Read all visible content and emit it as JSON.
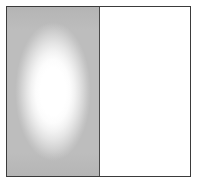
{
  "figure": {
    "title": "",
    "caption": "",
    "canvas": {
      "width_px": 197,
      "height_px": 183,
      "background_color": "#ffffff"
    },
    "frame": {
      "border_color": "#3b3b3b",
      "border_width_px": 1,
      "inset_px": 6
    },
    "divider": {
      "orientation": "vertical",
      "color": "#4a4a4a",
      "width_px": 1,
      "position_fraction": 0.51
    },
    "panels": [
      {
        "id": "left",
        "label": "",
        "type": "radial-gradient-field",
        "background_color": "#bdbdbd",
        "highlight_color": "#ffffff",
        "edge_color": "#bdbdbd",
        "highlight_shape": "ellipse",
        "highlight_center": [
          0.5,
          0.5
        ],
        "highlight_radius_fraction": [
          0.41,
          0.41
        ]
      },
      {
        "id": "right",
        "label": "",
        "type": "solid-field",
        "background_color": "#ffffff"
      }
    ]
  }
}
